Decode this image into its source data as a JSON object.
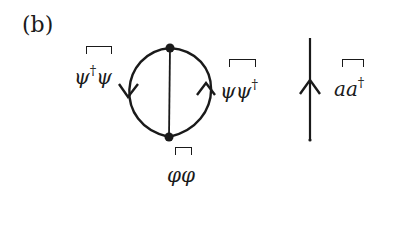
{
  "figure": {
    "panel_label": "(b)"
  },
  "diagram": {
    "left_group": {
      "vertices": [
        {
          "name": "top",
          "x": 170,
          "y": 48
        },
        {
          "name": "bottom",
          "x": 169,
          "y": 137
        }
      ],
      "edges": [
        {
          "name": "left-arc",
          "arrow_direction": "down",
          "label": {
            "base": "ψ",
            "dagger": "†",
            "tail": "ψ"
          }
        },
        {
          "name": "middle-line",
          "arrow_direction": "none",
          "label": {
            "text": "φφ"
          }
        },
        {
          "name": "right-arc",
          "arrow_direction": "up",
          "label": {
            "base": "ψψ",
            "dagger": "†"
          }
        }
      ]
    },
    "right_group": {
      "line": {
        "name": "vertical-propagator",
        "arrow_direction": "up"
      },
      "label": {
        "base": "aa",
        "dagger": "†"
      }
    }
  },
  "labels": {
    "left_arc": {
      "psi1": "ψ",
      "dagger": "†",
      "psi2": "ψ"
    },
    "right_arc": {
      "psi": "ψψ",
      "dagger": "†"
    },
    "middle": {
      "phi": "φφ"
    },
    "right_line": {
      "a": "aa",
      "dagger": "†"
    }
  },
  "colors": {
    "ink": "#1a1a1a",
    "background": "#ffffff"
  }
}
